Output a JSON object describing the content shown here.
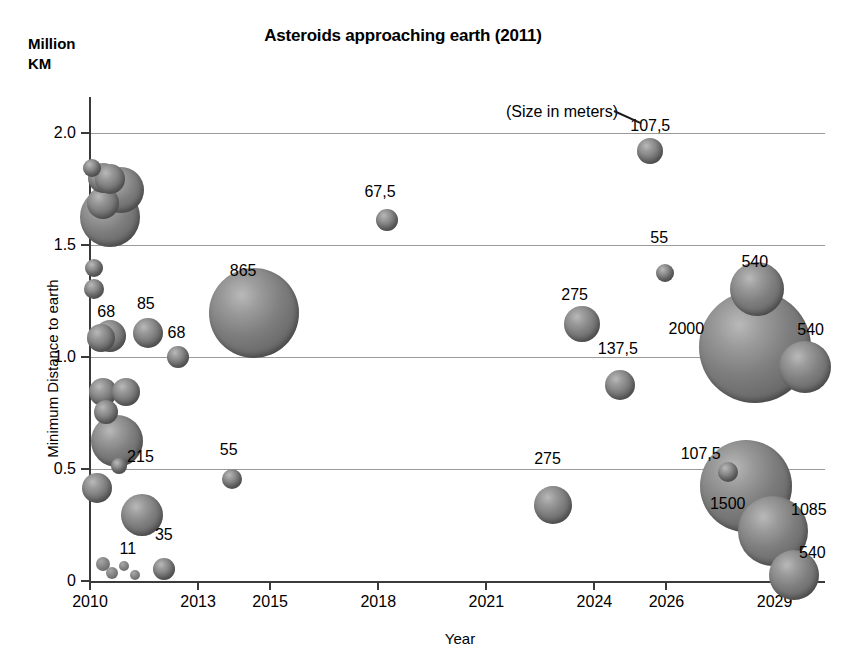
{
  "chart_data": {
    "type": "scatter",
    "title": "Asteroids approaching earth (2011)",
    "unit_label": "Million\nKM",
    "xlabel": "Year",
    "ylabel": "Minimum Distance to earth",
    "annotation": "(Size in meters)",
    "grid": true,
    "legend": "none",
    "xlim": [
      2010,
      2030.4
    ],
    "ylim": [
      0,
      2.16
    ],
    "xticks": [
      "2010",
      "2013",
      "2015",
      "2018",
      "2021",
      "2024",
      "2026",
      "2029"
    ],
    "xtick_values": [
      2010,
      2013,
      2015,
      2018,
      2021,
      2024,
      2026,
      2029
    ],
    "yticks": [
      "0",
      "0.5",
      "1.0",
      "1.5",
      "2.0"
    ],
    "ytick_values": [
      0,
      0.5,
      1.0,
      1.5,
      2.0
    ],
    "size_unit": "meters",
    "points": [
      {
        "year": 2010.05,
        "distance": 1.845,
        "size": 18,
        "label": ""
      },
      {
        "year": 2010.35,
        "distance": 1.8,
        "size": 30,
        "label": ""
      },
      {
        "year": 2010.55,
        "distance": 1.795,
        "size": 30,
        "label": ""
      },
      {
        "year": 2010.85,
        "distance": 1.745,
        "size": 46,
        "label": ""
      },
      {
        "year": 2010.35,
        "distance": 1.685,
        "size": 32,
        "label": ""
      },
      {
        "year": 2010.55,
        "distance": 1.625,
        "size": 60,
        "label": ""
      },
      {
        "year": 2010.1,
        "distance": 1.395,
        "size": 18,
        "label": ""
      },
      {
        "year": 2010.1,
        "distance": 1.305,
        "size": 20,
        "label": ""
      },
      {
        "year": 2010.3,
        "distance": 1.085,
        "size": 28,
        "label": "68"
      },
      {
        "year": 2010.55,
        "distance": 1.095,
        "size": 32,
        "label": ""
      },
      {
        "year": 2011.6,
        "distance": 1.105,
        "size": 30,
        "label": "85"
      },
      {
        "year": 2012.45,
        "distance": 1.0,
        "size": 22,
        "label": "68"
      },
      {
        "year": 2014.55,
        "distance": 1.195,
        "size": 90,
        "label": "865"
      },
      {
        "year": 2010.35,
        "distance": 0.845,
        "size": 28,
        "label": ""
      },
      {
        "year": 2011.0,
        "distance": 0.845,
        "size": 28,
        "label": ""
      },
      {
        "year": 2010.45,
        "distance": 0.755,
        "size": 24,
        "label": ""
      },
      {
        "year": 2010.75,
        "distance": 0.625,
        "size": 52,
        "label": "215"
      },
      {
        "year": 2010.8,
        "distance": 0.515,
        "size": 16,
        "label": ""
      },
      {
        "year": 2010.2,
        "distance": 0.415,
        "size": 30,
        "label": ""
      },
      {
        "year": 2013.95,
        "distance": 0.455,
        "size": 20,
        "label": "55"
      },
      {
        "year": 2011.45,
        "distance": 0.295,
        "size": 42,
        "label": "35"
      },
      {
        "year": 2010.35,
        "distance": 0.075,
        "size": 14,
        "label": ""
      },
      {
        "year": 2010.6,
        "distance": 0.035,
        "size": 12,
        "label": ""
      },
      {
        "year": 2010.95,
        "distance": 0.065,
        "size": 10,
        "label": "11"
      },
      {
        "year": 2011.25,
        "distance": 0.025,
        "size": 10,
        "label": ""
      },
      {
        "year": 2012.05,
        "distance": 0.055,
        "size": 22,
        "label": ""
      },
      {
        "year": 2018.25,
        "distance": 1.61,
        "size": 22,
        "label": "67,5"
      },
      {
        "year": 2025.55,
        "distance": 1.92,
        "size": 26,
        "label": "107,5"
      },
      {
        "year": 2025.95,
        "distance": 1.375,
        "size": 18,
        "label": "55"
      },
      {
        "year": 2023.65,
        "distance": 1.145,
        "size": 36,
        "label": "275"
      },
      {
        "year": 2024.7,
        "distance": 0.875,
        "size": 30,
        "label": "137,5"
      },
      {
        "year": 2022.85,
        "distance": 0.34,
        "size": 38,
        "label": "275"
      },
      {
        "year": 2028.5,
        "distance": 1.305,
        "size": 54,
        "label": "540"
      },
      {
        "year": 2028.45,
        "distance": 1.045,
        "size": 112,
        "label": "2000"
      },
      {
        "year": 2029.85,
        "distance": 0.955,
        "size": 52,
        "label": "540"
      },
      {
        "year": 2027.7,
        "distance": 0.485,
        "size": 20,
        "label": "107,5"
      },
      {
        "year": 2028.2,
        "distance": 0.425,
        "size": 92,
        "label": "1500"
      },
      {
        "year": 2028.95,
        "distance": 0.225,
        "size": 70,
        "label": "1085"
      },
      {
        "year": 2029.55,
        "distance": 0.025,
        "size": 50,
        "label": "540"
      }
    ],
    "labels": [
      {
        "text": "68",
        "year": 2010.45,
        "distance": 1.2
      },
      {
        "text": "85",
        "year": 2011.55,
        "distance": 1.235
      },
      {
        "text": "68",
        "year": 2012.4,
        "distance": 1.105
      },
      {
        "text": "865",
        "year": 2014.25,
        "distance": 1.385
      },
      {
        "text": "215",
        "year": 2011.4,
        "distance": 0.555
      },
      {
        "text": "55",
        "year": 2013.85,
        "distance": 0.585
      },
      {
        "text": "35",
        "year": 2012.05,
        "distance": 0.205
      },
      {
        "text": "11",
        "year": 2011.05,
        "distance": 0.145
      },
      {
        "text": "67,5",
        "year": 2018.05,
        "distance": 1.735
      },
      {
        "text": "107,5",
        "year": 2025.55,
        "distance": 2.03
      },
      {
        "text": "55",
        "year": 2025.8,
        "distance": 1.53
      },
      {
        "text": "275",
        "year": 2023.45,
        "distance": 1.275
      },
      {
        "text": "137,5",
        "year": 2024.65,
        "distance": 1.035
      },
      {
        "text": "2000",
        "year": 2026.55,
        "distance": 1.125
      },
      {
        "text": "540",
        "year": 2028.45,
        "distance": 1.425
      },
      {
        "text": "540",
        "year": 2030.0,
        "distance": 1.12
      },
      {
        "text": "275",
        "year": 2022.7,
        "distance": 0.545
      },
      {
        "text": "107,5",
        "year": 2026.95,
        "distance": 0.565
      },
      {
        "text": "1500",
        "year": 2027.7,
        "distance": 0.345
      },
      {
        "text": "1085",
        "year": 2029.95,
        "distance": 0.315
      },
      {
        "text": "540",
        "year": 2030.05,
        "distance": 0.125
      }
    ]
  }
}
